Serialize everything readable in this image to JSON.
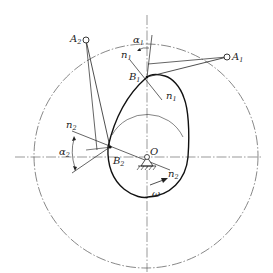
{
  "diagram": {
    "type": "cam-mechanism-pressure-angle",
    "labels": {
      "A1": {
        "main": "A",
        "sub": "1"
      },
      "A2": {
        "main": "A",
        "sub": "2"
      },
      "B1": {
        "main": "B",
        "sub": "1"
      },
      "B2": {
        "main": "B",
        "sub": "2"
      },
      "O": {
        "main": "O"
      },
      "n1_top": {
        "main": "n",
        "sub": "1"
      },
      "n1_bottom": {
        "main": "n",
        "sub": "1"
      },
      "n2_left": {
        "main": "n",
        "sub": "2"
      },
      "n2_right": {
        "main": "n",
        "sub": "2"
      },
      "alpha1": {
        "main": "α",
        "sub": "1"
      },
      "alpha2": {
        "main": "α",
        "sub": "2"
      },
      "omega": {
        "main": "ω"
      }
    },
    "colors": {
      "line": "#222222",
      "centerline": "#555555",
      "background": "#ffffff"
    }
  }
}
